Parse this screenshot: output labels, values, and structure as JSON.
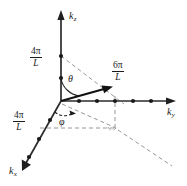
{
  "figure": {
    "colors": {
      "ink": "#1a1a1a",
      "axis": "#2b2b2b",
      "dashed": "#7a7a7a",
      "background": "#ffffff"
    },
    "axes": [
      {
        "name": "kz",
        "label_main": "k",
        "label_sub": "z"
      },
      {
        "name": "ky",
        "label_main": "k",
        "label_sub": "y"
      },
      {
        "name": "kx",
        "label_main": "k",
        "label_sub": "x"
      }
    ],
    "tick_labels": [
      {
        "name": "kz-tick",
        "numerator": "4π",
        "denominator": "L"
      },
      {
        "name": "kx-tick",
        "numerator": "4π",
        "denominator": "L"
      },
      {
        "name": "ky-tick",
        "numerator": "6π",
        "denominator": "L"
      }
    ],
    "angles": [
      {
        "name": "theta",
        "symbol": "θ"
      },
      {
        "name": "phi",
        "symbol": "φ"
      }
    ]
  }
}
